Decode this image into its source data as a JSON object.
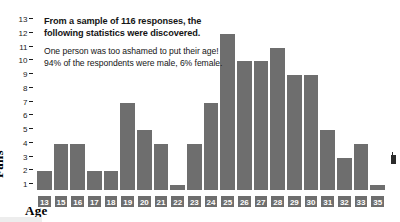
{
  "chart_data": {
    "type": "bar",
    "title": "",
    "xlabel": "Age",
    "ylabel": "Fans",
    "categories": [
      "13",
      "15",
      "16",
      "17",
      "18",
      "19",
      "20",
      "21",
      "22",
      "23",
      "24",
      "25",
      "26",
      "27",
      "28",
      "29",
      "30",
      "31",
      "32",
      "33",
      "35"
    ],
    "values": [
      2,
      4,
      4,
      2,
      2,
      7,
      5,
      4,
      1,
      4,
      7,
      12,
      10,
      10,
      11,
      9,
      9,
      5,
      3,
      4,
      1
    ],
    "ylim": [
      1,
      13
    ],
    "yticks": [
      1,
      2,
      3,
      4,
      5,
      6,
      7,
      8,
      9,
      10,
      11,
      12,
      13
    ],
    "ytick_labels": [
      "1",
      "2",
      "3",
      "4",
      "5",
      "6",
      "7",
      "8",
      "9",
      "10",
      "11",
      "12",
      "13"
    ],
    "grid": false,
    "legend": "none",
    "bar_color": "#6e6e6e",
    "label_text_color": "#ffffff"
  },
  "annotation": {
    "headline": "From a sample of 116 responses, the following statistics were discovered.",
    "body": "One person was too ashamed to put their age! 94% of the respondents were male, 6% female."
  },
  "axis": {
    "y_title": "Fans",
    "x_title": "Age"
  }
}
